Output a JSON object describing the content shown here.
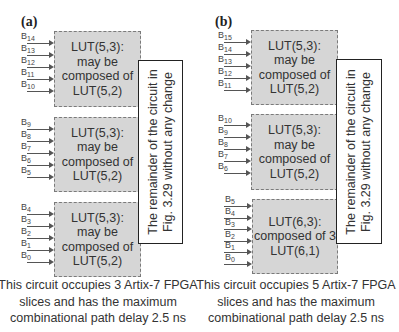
{
  "panels": [
    {
      "label": "(a)",
      "luts": [
        {
          "lines": [
            "LUT(5,3):",
            "may be",
            "composed of",
            "LUT(5,2)"
          ],
          "inputs": [
            "14",
            "13",
            "12",
            "11",
            "10"
          ]
        },
        {
          "lines": [
            "LUT(5,3):",
            "may be",
            "composed of",
            "LUT(5,2)"
          ],
          "inputs": [
            "9",
            "8",
            "7",
            "6",
            "5"
          ]
        },
        {
          "lines": [
            "LUT(5,3):",
            "may be",
            "composed of",
            "LUT(5,2)"
          ],
          "inputs": [
            "4",
            "3",
            "2",
            "1",
            "0"
          ]
        }
      ],
      "remainder_box": {
        "line1": "The remainder of the circuit in",
        "line2": "Fig. 3.29 without any change"
      },
      "caption": {
        "line1": "This circuit occupies 3 Artix-7 FPGA",
        "line2": "slices and has the maximum",
        "line3": "combinational path delay 2.5 ns"
      }
    },
    {
      "label": "(b)",
      "luts": [
        {
          "lines": [
            "LUT(5,3):",
            "may be",
            "composed of",
            "LUT(5,2)"
          ],
          "inputs": [
            "15",
            "14",
            "13",
            "12",
            "11"
          ]
        },
        {
          "lines": [
            "LUT(5,3):",
            "may be",
            "composed of",
            "LUT(5,2)"
          ],
          "inputs": [
            "10",
            "9",
            "8",
            "7",
            "6"
          ]
        },
        {
          "lines": [
            "LUT(6,3):",
            "composed of 3",
            "LUT(6,1)"
          ],
          "inputs": [
            "5",
            "4",
            "3",
            "2",
            "1",
            "0"
          ]
        }
      ],
      "remainder_box": {
        "line1": "The remainder of the circuit in",
        "line2": "Fig. 3.29 without any change"
      },
      "caption": {
        "line1": "This circuit occupies 5 Artix-7 FPGA",
        "line2": "slices and has the maximum",
        "line3": "combinational path delay 2.5 ns"
      }
    }
  ],
  "input_prefix": "B",
  "colors": {
    "lut_fill": "#d6d6d6",
    "lut_border": "#7a7a7a",
    "box_border": "#222222"
  }
}
